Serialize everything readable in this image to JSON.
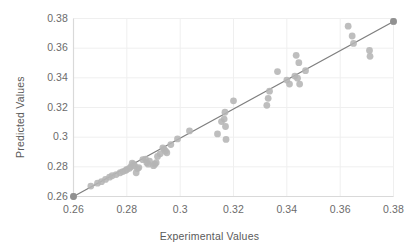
{
  "chart_data": {
    "type": "scatter",
    "title": "",
    "xlabel": "Experimental Values",
    "ylabel": "Predicted Values",
    "xlim": [
      0.26,
      0.38
    ],
    "ylim": [
      0.26,
      0.38
    ],
    "xticks": [
      "0.26",
      "0.28",
      "0.3",
      "0.32",
      "0.34",
      "0.36",
      "0.38"
    ],
    "yticks": [
      "0.26",
      "0.28",
      "0.3",
      "0.32",
      "0.34",
      "0.36",
      "0.38"
    ],
    "xtick_values": [
      0.26,
      0.28,
      0.3,
      0.32,
      0.34,
      0.36,
      0.38
    ],
    "ytick_values": [
      0.26,
      0.28,
      0.3,
      0.32,
      0.34,
      0.36,
      0.38
    ],
    "grid": true,
    "legend": "none",
    "marker_color": "#b5b5b5",
    "line_color": "#7f7f7f",
    "grid_color": "#efefef",
    "axis_color": "#d9d9d9",
    "text_color": "#5f5f5f",
    "series": [
      {
        "name": "Predicted vs Experimental",
        "points": [
          [
            0.26,
            0.26
          ],
          [
            0.2665,
            0.267
          ],
          [
            0.269,
            0.269
          ],
          [
            0.2705,
            0.27
          ],
          [
            0.272,
            0.2715
          ],
          [
            0.2735,
            0.273
          ],
          [
            0.2745,
            0.274
          ],
          [
            0.276,
            0.2748
          ],
          [
            0.2775,
            0.276
          ],
          [
            0.2785,
            0.2768
          ],
          [
            0.2795,
            0.2775
          ],
          [
            0.28,
            0.2782
          ],
          [
            0.281,
            0.279
          ],
          [
            0.2815,
            0.28
          ],
          [
            0.282,
            0.2825
          ],
          [
            0.2825,
            0.2818
          ],
          [
            0.283,
            0.2805
          ],
          [
            0.2835,
            0.276
          ],
          [
            0.284,
            0.2788
          ],
          [
            0.2845,
            0.2795
          ],
          [
            0.286,
            0.2848
          ],
          [
            0.287,
            0.2852
          ],
          [
            0.2875,
            0.2828
          ],
          [
            0.288,
            0.2818
          ],
          [
            0.2885,
            0.2838
          ],
          [
            0.29,
            0.2808
          ],
          [
            0.2905,
            0.2818
          ],
          [
            0.291,
            0.2828
          ],
          [
            0.2915,
            0.287
          ],
          [
            0.2925,
            0.2888
          ],
          [
            0.2935,
            0.2928
          ],
          [
            0.294,
            0.2918
          ],
          [
            0.2945,
            0.2905
          ],
          [
            0.295,
            0.2895
          ],
          [
            0.2965,
            0.295
          ],
          [
            0.299,
            0.2988
          ],
          [
            0.3035,
            0.3042
          ],
          [
            0.314,
            0.3022
          ],
          [
            0.3155,
            0.3105
          ],
          [
            0.3165,
            0.3122
          ],
          [
            0.3168,
            0.3168
          ],
          [
            0.317,
            0.3072
          ],
          [
            0.3172,
            0.2985
          ],
          [
            0.32,
            0.3245
          ],
          [
            0.3325,
            0.3215
          ],
          [
            0.333,
            0.3262
          ],
          [
            0.3335,
            0.331
          ],
          [
            0.3365,
            0.3442
          ],
          [
            0.34,
            0.3385
          ],
          [
            0.341,
            0.3358
          ],
          [
            0.343,
            0.3412
          ],
          [
            0.3435,
            0.3552
          ],
          [
            0.344,
            0.3398
          ],
          [
            0.3445,
            0.3502
          ],
          [
            0.3448,
            0.3358
          ],
          [
            0.347,
            0.3448
          ],
          [
            0.363,
            0.3748
          ],
          [
            0.3645,
            0.3682
          ],
          [
            0.365,
            0.3632
          ],
          [
            0.371,
            0.3585
          ],
          [
            0.3712,
            0.3545
          ],
          [
            0.38,
            0.378
          ]
        ]
      }
    ],
    "trendline": {
      "name": "identity-trend-line",
      "start": [
        0.26,
        0.26
      ],
      "end": [
        0.38,
        0.378
      ]
    }
  }
}
